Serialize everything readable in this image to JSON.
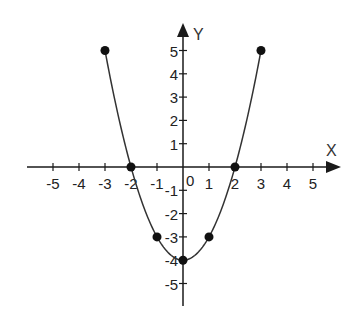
{
  "chart_data": {
    "type": "line",
    "title": "",
    "xlabel": "X",
    "ylabel": "Y",
    "xlim": [
      -5.5,
      6
    ],
    "ylim": [
      -5.5,
      6
    ],
    "grid": false,
    "legend": null,
    "x_ticks": [
      -5,
      -4,
      -3,
      -2,
      -1,
      1,
      2,
      3,
      4,
      5
    ],
    "y_ticks": [
      5,
      4,
      3,
      2,
      1,
      -1,
      -2,
      -3,
      -4,
      -5
    ],
    "origin_label": "0",
    "series": [
      {
        "name": "y = x^2 - 4",
        "curve": "parabola",
        "domain": [
          -3,
          3
        ],
        "points": [
          {
            "x": -3,
            "y": 5
          },
          {
            "x": -2,
            "y": 0
          },
          {
            "x": -1,
            "y": -3
          },
          {
            "x": 0,
            "y": -4
          },
          {
            "x": 1,
            "y": -3
          },
          {
            "x": 2,
            "y": 0
          },
          {
            "x": 3,
            "y": 5
          }
        ]
      }
    ]
  },
  "style": {
    "axis_color": "#1a1a1a",
    "curve_color": "#333333",
    "point_color": "#111111",
    "background": "#ffffff"
  },
  "layout": {
    "origin_px": [
      183,
      167
    ],
    "unit_x_px": 26,
    "unit_y_px": 23.3
  }
}
